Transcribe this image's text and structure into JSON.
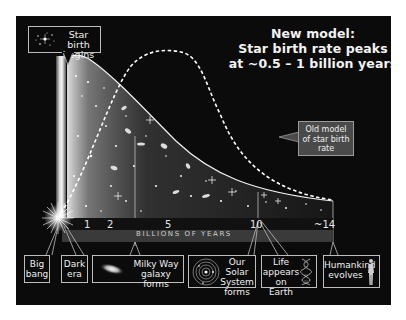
{
  "title": {
    "line1": "New model:",
    "line2": "Star birth rate peaks",
    "line3": "at ~0.5 – 1 billion years"
  },
  "callouts": {
    "star_birth": {
      "line1": "Star birth",
      "line2": "begins"
    },
    "old_model": {
      "line1": "Old model",
      "line2": "of star birth",
      "line3": "rate"
    }
  },
  "axis": {
    "label": "BILLIONS OF YEARS",
    "ticks": [
      "1",
      "2",
      "5",
      "10",
      "~14"
    ]
  },
  "events": [
    {
      "id": "big-bang",
      "line1": "Big",
      "line2": "bang"
    },
    {
      "id": "dark-era",
      "line1": "Dark",
      "line2": "era"
    },
    {
      "id": "milky-way",
      "line1": "Milky Way",
      "line2": "galaxy forms"
    },
    {
      "id": "solar-system",
      "line1": "Our Solar",
      "line2": "System",
      "line3": "forms"
    },
    {
      "id": "life",
      "line1": "Life",
      "line2": "appears",
      "line3": "on Earth"
    },
    {
      "id": "humankind",
      "line1": "Humankind",
      "line2": "evolves"
    }
  ],
  "curves": {
    "new_model": "solid",
    "old_model": "dashed"
  },
  "colors": {
    "background": "#0b0b0b",
    "text": "#f0f0f0",
    "axis_band": "#3a3a3a",
    "old_model_box": "#4a4a4a"
  }
}
